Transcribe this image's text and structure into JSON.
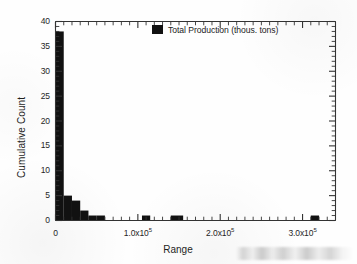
{
  "chart_data": {
    "type": "bar",
    "title": "",
    "subtitle": "",
    "xlabel": "Range",
    "ylabel": "Cumulative Count",
    "xlim": [
      0,
      340000
    ],
    "ylim": [
      0,
      40
    ],
    "grid": false,
    "legend_position": "top-center",
    "bar_color": "#111111",
    "axis_color": "#333333",
    "series": [
      {
        "name": "Total Production (thous. tons)",
        "bins": [
          {
            "x_start": 0,
            "x_end": 10000,
            "value": 38
          },
          {
            "x_start": 10000,
            "x_end": 20000,
            "value": 5
          },
          {
            "x_start": 20000,
            "x_end": 30000,
            "value": 4
          },
          {
            "x_start": 30000,
            "x_end": 40000,
            "value": 2
          },
          {
            "x_start": 40000,
            "x_end": 50000,
            "value": 1
          },
          {
            "x_start": 50000,
            "x_end": 60000,
            "value": 1
          },
          {
            "x_start": 105000,
            "x_end": 115000,
            "value": 1
          },
          {
            "x_start": 140000,
            "x_end": 155000,
            "value": 1
          },
          {
            "x_start": 310000,
            "x_end": 320000,
            "value": 1
          }
        ]
      }
    ],
    "x_ticks": [
      {
        "value": 0,
        "label": "0",
        "mantissa": "0",
        "exponent": ""
      },
      {
        "value": 100000,
        "label": "1.0x10^5",
        "mantissa": "1.0x10",
        "exponent": "5"
      },
      {
        "value": 200000,
        "label": "2.0x10^5",
        "mantissa": "2.0x10",
        "exponent": "5"
      },
      {
        "value": 300000,
        "label": "3.0x10^5",
        "mantissa": "3.0x10",
        "exponent": "5"
      }
    ],
    "x_minor_tick_step": 10000,
    "y_ticks": [
      {
        "value": 0,
        "label": "0"
      },
      {
        "value": 5,
        "label": "5"
      },
      {
        "value": 10,
        "label": "10"
      },
      {
        "value": 15,
        "label": "15"
      },
      {
        "value": 20,
        "label": "20"
      },
      {
        "value": 25,
        "label": "25"
      },
      {
        "value": 30,
        "label": "30"
      },
      {
        "value": 35,
        "label": "35"
      },
      {
        "value": 40,
        "label": "40"
      }
    ],
    "y_minor_tick_step": 1
  },
  "legend": {
    "entries": [
      {
        "label": "Total Production (thous. tons)",
        "color": "#111111",
        "marker": "filled-square"
      }
    ]
  },
  "axes": {
    "x_title": "Range",
    "y_title": "Cumulative Count"
  }
}
